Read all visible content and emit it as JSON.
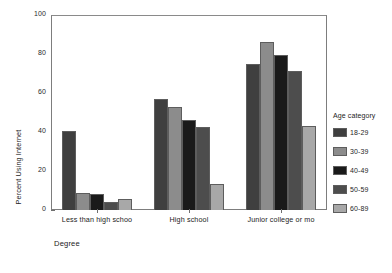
{
  "chart_data": {
    "type": "bar",
    "title": "",
    "xlabel": "Degree",
    "ylabel": "Percent Using Internet",
    "ylim": [
      0,
      100
    ],
    "yticks": [
      0,
      20,
      40,
      60,
      80,
      100
    ],
    "ytick_labels": [
      "0",
      "20",
      "40",
      "60",
      "80",
      "100"
    ],
    "grid": false,
    "legend_position": "right",
    "legend_title": "Age category",
    "categories": [
      "Less than high schoo",
      "High school",
      "Junior college or mo"
    ],
    "series": [
      {
        "name": "18-29",
        "color": "#3f3f3f",
        "values": [
          40.5,
          57,
          75
        ]
      },
      {
        "name": "30-39",
        "color": "#8c8c8c",
        "values": [
          8.5,
          53,
          86
        ]
      },
      {
        "name": "40-49",
        "color": "#1a1a1a",
        "values": [
          8,
          46,
          79.5
        ]
      },
      {
        "name": "50-59",
        "color": "#4d4d4d",
        "values": [
          4,
          42.5,
          71.5
        ]
      },
      {
        "name": "60-89",
        "color": "#a8a8a8",
        "values": [
          5.5,
          13.5,
          43
        ]
      }
    ]
  },
  "axes": {
    "frame_color": "#7d7d7d",
    "tick_color": "#6f6f6f"
  }
}
